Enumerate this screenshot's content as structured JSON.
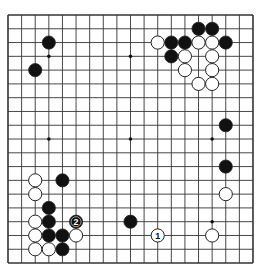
{
  "board": {
    "size": 19,
    "origin": {
      "x": 8,
      "y": 15
    },
    "spacing": {
      "x": 13.61,
      "y": 13.78
    },
    "stone_radius": 6.6,
    "colors": {
      "background": "#ffffff",
      "line": "#333333",
      "black_stone": "#111111",
      "white_stone": "#ffffff",
      "stone_outline": "#222222"
    },
    "star_points": [
      [
        3,
        3
      ],
      [
        9,
        3
      ],
      [
        15,
        3
      ],
      [
        3,
        9
      ],
      [
        9,
        9
      ],
      [
        15,
        9
      ],
      [
        3,
        15
      ],
      [
        9,
        15
      ],
      [
        15,
        15
      ]
    ],
    "black_stones": [
      [
        3,
        2
      ],
      [
        2,
        4
      ],
      [
        14,
        1
      ],
      [
        15,
        1
      ],
      [
        12,
        2
      ],
      [
        13,
        2
      ],
      [
        16,
        2
      ],
      [
        12,
        3
      ],
      [
        16,
        8
      ],
      [
        16,
        11
      ],
      [
        4,
        12
      ],
      [
        3,
        14
      ],
      [
        3,
        15
      ],
      [
        3,
        16
      ],
      [
        4,
        16
      ],
      [
        4,
        17
      ],
      [
        9,
        15
      ]
    ],
    "white_stones": [
      [
        11,
        2
      ],
      [
        14,
        2
      ],
      [
        15,
        2
      ],
      [
        13,
        3
      ],
      [
        15,
        3
      ],
      [
        13,
        4
      ],
      [
        15,
        4
      ],
      [
        14,
        5
      ],
      [
        15,
        5
      ],
      [
        16,
        13
      ],
      [
        15,
        16
      ],
      [
        2,
        12
      ],
      [
        2,
        13
      ],
      [
        2,
        15
      ],
      [
        2,
        16
      ],
      [
        5,
        16
      ],
      [
        2,
        17
      ],
      [
        3,
        17
      ]
    ],
    "numbered_moves": [
      {
        "number": "1",
        "color": "white",
        "col": 11,
        "row": 16
      },
      {
        "number": "2",
        "color": "black",
        "col": 5,
        "row": 15
      }
    ]
  }
}
